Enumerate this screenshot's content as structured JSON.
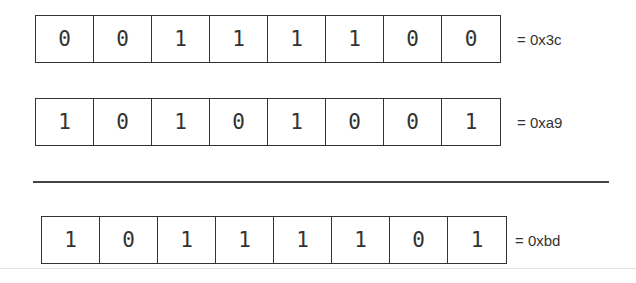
{
  "rows": [
    {
      "bits": [
        "0",
        "0",
        "1",
        "1",
        "1",
        "1",
        "0",
        "0"
      ],
      "label": "= 0x3c"
    },
    {
      "bits": [
        "1",
        "0",
        "1",
        "0",
        "1",
        "0",
        "0",
        "1"
      ],
      "label": "= 0xa9"
    },
    {
      "bits": [
        "1",
        "0",
        "1",
        "1",
        "1",
        "1",
        "0",
        "1"
      ],
      "label": "= 0xbd"
    }
  ]
}
